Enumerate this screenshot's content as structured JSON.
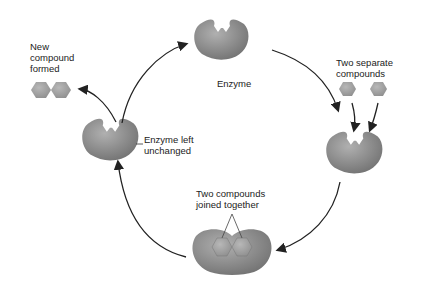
{
  "diagram": {
    "type": "enzyme-catalysis-cycle",
    "labels": {
      "enzyme": "Enzyme",
      "two_separate": "Two separate\ncompounds",
      "joined": "Two compounds\njoined together",
      "enzyme_left": "Enzyme left\nunchanged",
      "new_compound": "New\ncompound\nformed"
    },
    "colors": {
      "enzyme_fill": "#8c8c8c",
      "compound_fill": "#9a9a9a",
      "arrow": "#222222"
    }
  }
}
